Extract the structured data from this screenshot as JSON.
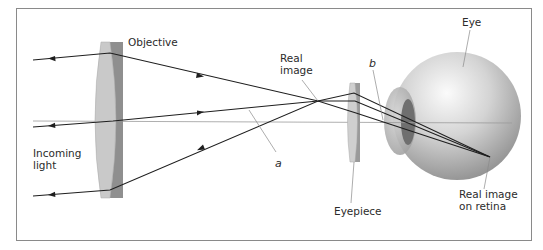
{
  "diagram": {
    "type": "optics-ray-diagram",
    "labels": {
      "objective": "Objective",
      "incoming_light_line1": "Incoming",
      "incoming_light_line2": "light",
      "real_image_line1": "Real",
      "real_image_line2": "image",
      "angle_a": "a",
      "angle_b": "b",
      "eyepiece": "Eyepiece",
      "eye": "Eye",
      "retina_image_line1": "Real image",
      "retina_image_line2": "on retina"
    },
    "components": [
      {
        "id": "objective-lens",
        "label": "Objective"
      },
      {
        "id": "real-image-point",
        "label": "Real image"
      },
      {
        "id": "eyepiece-lens",
        "label": "Eyepiece"
      },
      {
        "id": "eye",
        "label": "Eye"
      },
      {
        "id": "retina-image-point",
        "label": "Real image on retina"
      }
    ],
    "rays": [
      {
        "name": "top-ray",
        "from": "incoming light",
        "through": [
          "objective",
          "real image",
          "eyepiece"
        ],
        "to": "retina"
      },
      {
        "name": "middle-ray",
        "from": "incoming light",
        "through": [
          "objective",
          "real image",
          "eyepiece"
        ],
        "to": "retina"
      },
      {
        "name": "bottom-ray",
        "from": "incoming light",
        "through": [
          "objective",
          "real image",
          "eyepiece"
        ],
        "to": "retina"
      }
    ],
    "angles": [
      {
        "name": "a",
        "description": "angle between middle ray and optical axis after objective"
      },
      {
        "name": "b",
        "description": "angle at which rays enter the eye"
      }
    ],
    "colors": {
      "frame": "#8a8a8a",
      "ray": "#1e1e1e",
      "axis": "#9a9a9a",
      "lens_light": "#c9c9c9",
      "lens_dark": "#8f8f8f",
      "eye_light": "#f2f2f2",
      "eye_dark": "#8d8d8d",
      "eye_lens": "#6f6f6f"
    }
  }
}
